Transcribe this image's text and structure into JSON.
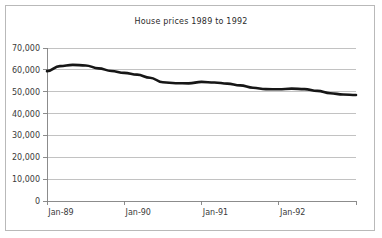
{
  "chart_data": {
    "type": "line",
    "title": "House prices 1989 to 1992",
    "xlabel": "",
    "ylabel": "",
    "ylim": [
      0,
      70000
    ],
    "yticks": [
      0,
      10000,
      20000,
      30000,
      40000,
      50000,
      60000,
      70000
    ],
    "ytick_labels": [
      "0",
      "10,000",
      "20,000",
      "30,000",
      "40,000",
      "50,000",
      "60,000",
      "70,000"
    ],
    "xtick_labels": [
      "Jan-89",
      "Jan-90",
      "Jan-91",
      "Jan-92"
    ],
    "xtick_positions": [
      0,
      12,
      24,
      36
    ],
    "xlim": [
      0,
      48
    ],
    "grid": true,
    "legend": false,
    "series_color": "#161616",
    "x": [
      0,
      2,
      4,
      6,
      8,
      10,
      12,
      14,
      16,
      18,
      20,
      22,
      24,
      26,
      28,
      30,
      32,
      34,
      36,
      38,
      40,
      42,
      44,
      46,
      48
    ],
    "values": [
      59400,
      61700,
      62300,
      62000,
      60700,
      59500,
      58600,
      57800,
      56400,
      54300,
      53900,
      53800,
      54500,
      54200,
      53700,
      52900,
      51800,
      51200,
      51100,
      51400,
      51200,
      50400,
      49300,
      48700,
      48500
    ],
    "series": [
      {
        "name": "House prices",
        "values": [
          59400,
          61700,
          62300,
          62000,
          60700,
          59500,
          58600,
          57800,
          56400,
          54300,
          53900,
          53800,
          54500,
          54200,
          53700,
          52900,
          51800,
          51200,
          51100,
          51400,
          51200,
          50400,
          49300,
          48700,
          48500
        ]
      }
    ]
  }
}
